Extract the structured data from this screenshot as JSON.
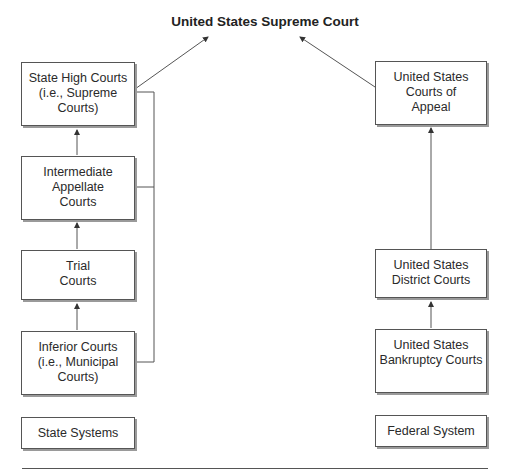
{
  "title": "United States Supreme Court",
  "state": {
    "boxes": [
      {
        "id": "state-high",
        "label": "State High Courts\n(i.e., Supreme\nCourts)"
      },
      {
        "id": "intermediate-appellate",
        "label": "Intermediate\nAppellate\nCourts"
      },
      {
        "id": "trial",
        "label": "Trial\nCourts"
      },
      {
        "id": "inferior",
        "label": "Inferior Courts\n(i.e., Municipal\nCourts)"
      }
    ],
    "legend": "State Systems"
  },
  "federal": {
    "boxes": [
      {
        "id": "courts-of-appeal",
        "label": "United States\nCourts of\nAppeal"
      },
      {
        "id": "district",
        "label": "United States\nDistrict Courts"
      },
      {
        "id": "bankruptcy",
        "label": "United States\nBankruptcy Courts"
      }
    ],
    "legend": "Federal System"
  },
  "colors": {
    "line": "#555555",
    "shadow": "#9a9a9a"
  }
}
